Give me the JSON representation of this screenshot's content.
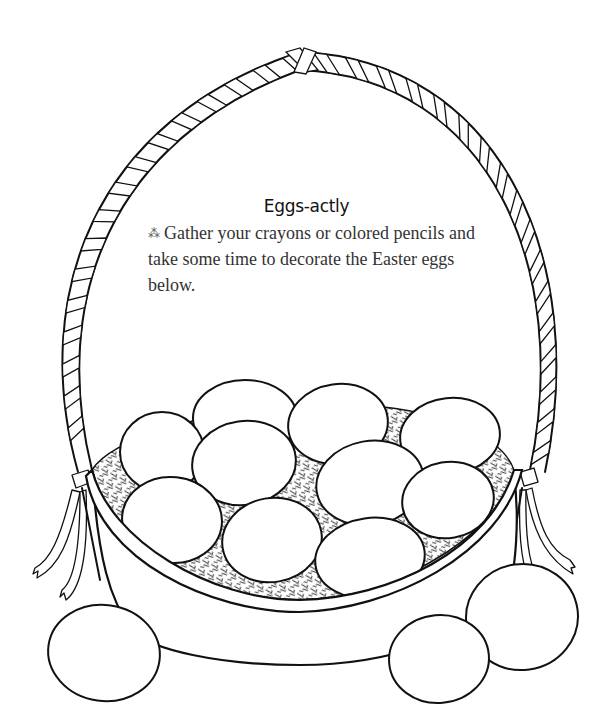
{
  "page": {
    "title": "Eggs-actly",
    "instruction": {
      "bullet_icon": "sparkle-bullet-icon",
      "bullet_glyph": "⁂",
      "text": "Gather your crayons or colored pencils and take some time to decorate the Easter eggs below."
    }
  },
  "illustration": {
    "subject": "Easter basket coloring page",
    "eggs_in_basket": 10,
    "eggs_outside_basket": 3,
    "line_color": "#111111",
    "background_color": "#ffffff"
  }
}
